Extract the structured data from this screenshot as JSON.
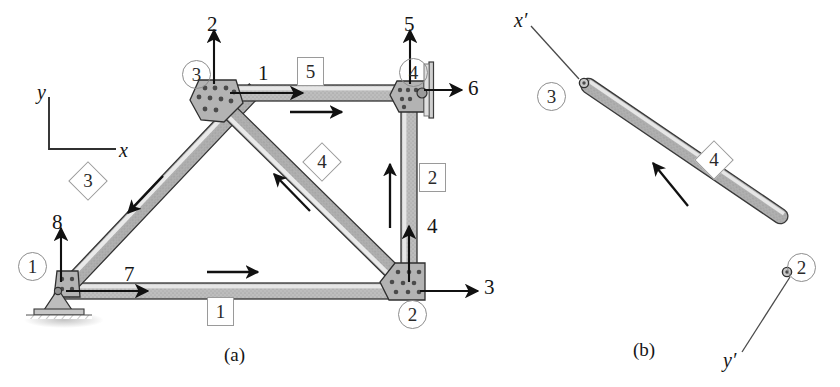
{
  "figure": {
    "captions": {
      "a": "(a)",
      "b": "(b)"
    }
  },
  "panel_a": {
    "global_axes": {
      "x_label": "x",
      "y_label": "y"
    },
    "nodes": [
      {
        "id": "1",
        "label": "1",
        "support": "pinned",
        "x": 62,
        "y": 296
      },
      {
        "id": "2",
        "label": "2",
        "support": "none",
        "x": 413,
        "y": 291
      },
      {
        "id": "3",
        "label": "3",
        "support": "none",
        "x": 213,
        "y": 93
      },
      {
        "id": "4",
        "label": "4",
        "support": "roller",
        "x": 410,
        "y": 93
      }
    ],
    "node_circle_labels": [
      {
        "label": "1",
        "left": 18,
        "top": 252
      },
      {
        "label": "2",
        "left": 398,
        "top": 300
      },
      {
        "label": "3",
        "left": 182,
        "top": 60
      },
      {
        "label": "4",
        "left": 399,
        "top": 58
      }
    ],
    "members": [
      {
        "label": "1",
        "style": "box",
        "from": "1",
        "to": "2",
        "left": 207,
        "top": 297
      },
      {
        "label": "2",
        "style": "box",
        "from": "2",
        "to": "4",
        "left": 419,
        "top": 163
      },
      {
        "label": "3",
        "style": "diamond",
        "from": "1",
        "to": "3",
        "left": 74,
        "top": 167
      },
      {
        "label": "4",
        "style": "diamond",
        "from": "2",
        "to": "3",
        "left": 308,
        "top": 148
      },
      {
        "label": "5",
        "style": "box",
        "from": "3",
        "to": "4",
        "left": 297,
        "top": 57
      }
    ],
    "dof_labels": [
      {
        "label": "7",
        "direction": "x-positive",
        "left": 124,
        "top": 264
      },
      {
        "label": "8",
        "direction": "y-positive",
        "left": 52,
        "top": 212
      },
      {
        "label": "3",
        "direction": "x-positive",
        "left": 455,
        "top": 272
      },
      {
        "label": "4",
        "direction": "y-positive",
        "left": 427,
        "top": 216
      },
      {
        "label": "1",
        "direction": "x-positive",
        "left": 258,
        "top": 63
      },
      {
        "label": "2",
        "direction": "y-positive",
        "left": 207,
        "top": 14
      },
      {
        "label": "5",
        "direction": "y-positive",
        "left": 404,
        "top": 14
      },
      {
        "label": "6",
        "direction": "x-positive",
        "left": 466,
        "top": 73
      }
    ]
  },
  "panel_b": {
    "local_axes": {
      "x_label": "x′",
      "y_label": "y′"
    },
    "member": {
      "label": "4",
      "style": "diamond",
      "left": 700,
      "top": 146
    },
    "end_nodes": [
      {
        "label": "3",
        "left": 537,
        "top": 82
      },
      {
        "label": "2",
        "left": 787,
        "top": 253
      }
    ]
  },
  "colors": {
    "member_fill": "#b9b9b9",
    "member_edge": "#3a3a3a",
    "member_highlight": "#e4e4e4",
    "gusset_fill": "#b5b5b5",
    "label_outline": "#9a9a9a",
    "arrow": "#111111",
    "ground": "#8f8f8f"
  }
}
